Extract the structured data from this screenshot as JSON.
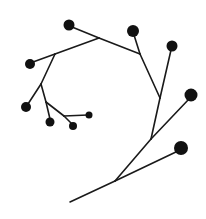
{
  "diagram": {
    "type": "cymose-inflorescence",
    "stroke_color": "#1a1a1a",
    "node_color": "#111111",
    "background": "#ffffff",
    "stems": [
      {
        "x1": 70,
        "y1": 202,
        "x2": 115,
        "y2": 181
      },
      {
        "x1": 115,
        "y1": 181,
        "x2": 151,
        "y2": 139
      },
      {
        "x1": 115,
        "y1": 181,
        "x2": 178,
        "y2": 151
      },
      {
        "x1": 151,
        "y1": 139,
        "x2": 160,
        "y2": 98
      },
      {
        "x1": 151,
        "y1": 139,
        "x2": 189,
        "y2": 99
      },
      {
        "x1": 160,
        "y1": 98,
        "x2": 140,
        "y2": 54
      },
      {
        "x1": 160,
        "y1": 98,
        "x2": 171,
        "y2": 50
      },
      {
        "x1": 140,
        "y1": 54,
        "x2": 99,
        "y2": 38
      },
      {
        "x1": 140,
        "y1": 54,
        "x2": 134,
        "y2": 35
      },
      {
        "x1": 99,
        "y1": 38,
        "x2": 72,
        "y2": 27
      },
      {
        "x1": 99,
        "y1": 38,
        "x2": 55,
        "y2": 54
      },
      {
        "x1": 55,
        "y1": 54,
        "x2": 33,
        "y2": 62
      },
      {
        "x1": 55,
        "y1": 54,
        "x2": 41,
        "y2": 84
      },
      {
        "x1": 41,
        "y1": 84,
        "x2": 28,
        "y2": 104
      },
      {
        "x1": 41,
        "y1": 84,
        "x2": 46,
        "y2": 102
      },
      {
        "x1": 46,
        "y1": 102,
        "x2": 50,
        "y2": 119
      },
      {
        "x1": 46,
        "y1": 102,
        "x2": 64,
        "y2": 116
      },
      {
        "x1": 64,
        "y1": 116,
        "x2": 72,
        "y2": 124
      },
      {
        "x1": 64,
        "y1": 116,
        "x2": 88,
        "y2": 115
      }
    ],
    "flowers": [
      {
        "id": "flower-1",
        "cx": 181,
        "cy": 148,
        "r": 7
      },
      {
        "id": "flower-2",
        "cx": 191,
        "cy": 95,
        "r": 6.5
      },
      {
        "id": "flower-3",
        "cx": 172,
        "cy": 46,
        "r": 5.5
      },
      {
        "id": "flower-4",
        "cx": 133,
        "cy": 31,
        "r": 6
      },
      {
        "id": "flower-5",
        "cx": 69,
        "cy": 25,
        "r": 5.5
      },
      {
        "id": "flower-6",
        "cx": 30,
        "cy": 64,
        "r": 5
      },
      {
        "id": "flower-7",
        "cx": 26,
        "cy": 107,
        "r": 5
      },
      {
        "id": "flower-8",
        "cx": 50,
        "cy": 122,
        "r": 4.5
      },
      {
        "id": "flower-9",
        "cx": 73,
        "cy": 126,
        "r": 4
      },
      {
        "id": "flower-10",
        "cx": 89,
        "cy": 115,
        "r": 3.5
      }
    ]
  }
}
